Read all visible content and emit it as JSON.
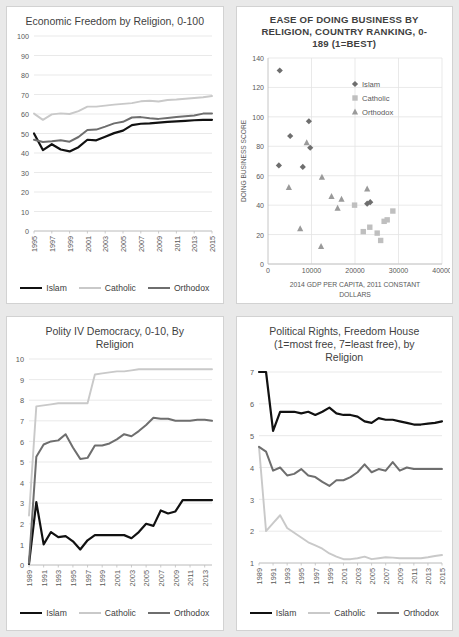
{
  "page": {
    "background": "#e9e9e9",
    "panel_background": "#ffffff",
    "panels": 4
  },
  "colors": {
    "islam": "#111111",
    "catholic": "#c9c9c9",
    "orthodox": "#6e6e6e",
    "grid": "#e3e3e3",
    "axis": "#bfbfbf",
    "text": "#595959",
    "title": "#3f3f3f"
  },
  "legend_labels": {
    "islam": "Islam",
    "catholic": "Catholic",
    "orthodox": "Orthodox"
  },
  "chart_data": [
    {
      "id": "economic-freedom",
      "type": "line",
      "title": "Economic Freedom by Religion, 0-100",
      "xlabel": "",
      "ylabel": "",
      "ylim": [
        0,
        100
      ],
      "yticks": [
        0,
        10,
        20,
        30,
        40,
        50,
        60,
        70,
        80,
        90,
        100
      ],
      "xlim": [
        1995,
        2015
      ],
      "x": [
        1995,
        1996,
        1997,
        1998,
        1999,
        2000,
        2001,
        2002,
        2003,
        2004,
        2005,
        2006,
        2007,
        2008,
        2009,
        2010,
        2011,
        2012,
        2013,
        2014,
        2015
      ],
      "xticks": [
        1995,
        1997,
        1999,
        2001,
        2003,
        2005,
        2007,
        2009,
        2011,
        2013,
        2015
      ],
      "grid": true,
      "legend_position": "bottom",
      "series": [
        {
          "name": "Islam",
          "color": "#111111",
          "values": [
            50.0,
            41.5,
            44.5,
            41.8,
            40.8,
            43.0,
            46.8,
            46.5,
            48.3,
            50.2,
            51.5,
            54.3,
            55.0,
            55.2,
            55.6,
            56.0,
            56.2,
            56.5,
            56.8,
            57.0,
            57.0
          ]
        },
        {
          "name": "Catholic",
          "color": "#c9c9c9",
          "values": [
            60.2,
            57.0,
            59.8,
            60.3,
            60.0,
            61.5,
            63.8,
            63.8,
            64.3,
            64.8,
            65.2,
            65.6,
            66.5,
            66.8,
            66.4,
            67.2,
            67.4,
            67.8,
            68.2,
            68.6,
            69.2
          ]
        },
        {
          "name": "Orthodox",
          "color": "#6e6e6e",
          "values": [
            46.8,
            45.6,
            46.0,
            46.5,
            45.8,
            48.2,
            51.8,
            52.0,
            53.5,
            55.2,
            56.0,
            58.2,
            58.4,
            57.8,
            57.5,
            58.0,
            58.4,
            58.8,
            59.2,
            60.2,
            60.2
          ]
        }
      ]
    },
    {
      "id": "ease-of-doing-business",
      "type": "scatter",
      "title": "EASE OF DOING BUSINESS BY RELIGION, COUNTRY RANKING, 0-189 (1=BEST)",
      "xlabel": "2014 GDP PER CAPITA, 2011 CONSTANT DOLLARS",
      "ylabel": "DOING BUSINESS SCORE",
      "xlim": [
        0,
        40000
      ],
      "ylim": [
        0,
        140
      ],
      "yticks": [
        0,
        20,
        40,
        60,
        80,
        100,
        120,
        140
      ],
      "xticks": [
        0,
        10000,
        20000,
        30000,
        40000
      ],
      "grid": true,
      "legend_position": "inside-top-right",
      "series": [
        {
          "name": "Islam",
          "color": "#6e6e6e",
          "marker": "diamond",
          "points": [
            [
              2700,
              131.5
            ],
            [
              5100,
              87
            ],
            [
              9400,
              97
            ],
            [
              9700,
              79
            ],
            [
              2500,
              67
            ],
            [
              8000,
              66
            ],
            [
              22800,
              41
            ],
            [
              23500,
              42
            ]
          ]
        },
        {
          "name": "Catholic",
          "color": "#bfbfbf",
          "marker": "square",
          "points": [
            [
              19900,
              40
            ],
            [
              21900,
              22
            ],
            [
              23400,
              25
            ],
            [
              25100,
              21
            ],
            [
              25900,
              16
            ],
            [
              26700,
              29
            ],
            [
              27400,
              30
            ],
            [
              28700,
              36
            ]
          ]
        },
        {
          "name": "Orthodox",
          "color": "#9a9a9a",
          "marker": "triangle",
          "points": [
            [
              4800,
              52
            ],
            [
              7400,
              24
            ],
            [
              8900,
              82.5
            ],
            [
              12400,
              59
            ],
            [
              12200,
              12
            ],
            [
              14600,
              46
            ],
            [
              16000,
              38
            ],
            [
              16900,
              44
            ],
            [
              22800,
              51
            ]
          ]
        }
      ]
    },
    {
      "id": "polity-iv-democracy",
      "type": "line",
      "title": "Polity IV Democracy, 0-10, By Religion",
      "xlabel": "",
      "ylabel": "",
      "ylim": [
        0,
        10
      ],
      "yticks": [
        0,
        1,
        2,
        3,
        4,
        5,
        6,
        7,
        8,
        9,
        10
      ],
      "xlim": [
        1989,
        2014
      ],
      "x": [
        1989,
        1990,
        1991,
        1992,
        1993,
        1994,
        1995,
        1996,
        1997,
        1998,
        1999,
        2000,
        2001,
        2002,
        2003,
        2004,
        2005,
        2006,
        2007,
        2008,
        2009,
        2010,
        2011,
        2012,
        2013,
        2014
      ],
      "xticks": [
        1989,
        1991,
        1993,
        1995,
        1997,
        1999,
        2001,
        2003,
        2005,
        2007,
        2009,
        2011,
        2013
      ],
      "grid": true,
      "legend_position": "bottom",
      "series": [
        {
          "name": "Islam",
          "color": "#111111",
          "values": [
            0.05,
            3.05,
            1.0,
            1.6,
            1.35,
            1.4,
            1.15,
            0.75,
            1.2,
            1.45,
            1.45,
            1.45,
            1.45,
            1.45,
            1.3,
            1.6,
            2.0,
            1.9,
            2.65,
            2.5,
            2.6,
            3.15,
            3.15,
            3.15,
            3.15,
            3.15
          ]
        },
        {
          "name": "Catholic",
          "color": "#c9c9c9",
          "values": [
            2.4,
            7.7,
            7.75,
            7.8,
            7.85,
            7.85,
            7.85,
            7.85,
            7.85,
            9.25,
            9.3,
            9.35,
            9.4,
            9.4,
            9.45,
            9.5,
            9.5,
            9.5,
            9.5,
            9.5,
            9.5,
            9.5,
            9.5,
            9.5,
            9.5,
            9.5
          ]
        },
        {
          "name": "Orthodox",
          "color": "#6e6e6e",
          "values": [
            0.1,
            5.25,
            5.85,
            6.0,
            6.05,
            6.35,
            5.7,
            5.15,
            5.2,
            5.8,
            5.8,
            5.9,
            6.1,
            6.35,
            6.25,
            6.5,
            6.8,
            7.15,
            7.1,
            7.1,
            7.0,
            7.0,
            7.0,
            7.05,
            7.05,
            7.0
          ]
        }
      ]
    },
    {
      "id": "political-rights-freedom-house",
      "type": "line",
      "title": "Political Rights, Freedom House (1=most free, 7=least free), by Religion",
      "xlabel": "",
      "ylabel": "",
      "ylim": [
        1,
        7
      ],
      "yticks": [
        1,
        2,
        3,
        4,
        5,
        6,
        7
      ],
      "xlim": [
        1989,
        2015
      ],
      "x": [
        1989,
        1990,
        1991,
        1992,
        1993,
        1994,
        1995,
        1996,
        1997,
        1998,
        1999,
        2000,
        2001,
        2002,
        2003,
        2004,
        2005,
        2006,
        2007,
        2008,
        2009,
        2010,
        2011,
        2012,
        2013,
        2014,
        2015
      ],
      "xticks": [
        1989,
        1991,
        1993,
        1995,
        1997,
        1999,
        2001,
        2003,
        2005,
        2007,
        2009,
        2011,
        2013,
        2015
      ],
      "grid": true,
      "legend_position": "bottom",
      "series": [
        {
          "name": "Islam",
          "color": "#111111",
          "values": [
            7.0,
            7.0,
            5.15,
            5.75,
            5.75,
            5.75,
            5.7,
            5.75,
            5.65,
            5.75,
            5.88,
            5.7,
            5.65,
            5.65,
            5.6,
            5.45,
            5.4,
            5.55,
            5.5,
            5.5,
            5.45,
            5.4,
            5.35,
            5.35,
            5.38,
            5.4,
            5.45
          ]
        },
        {
          "name": "Catholic",
          "color": "#c9c9c9",
          "values": [
            4.65,
            2.0,
            2.25,
            2.5,
            2.1,
            1.95,
            1.8,
            1.65,
            1.55,
            1.45,
            1.3,
            1.2,
            1.12,
            1.12,
            1.15,
            1.2,
            1.12,
            1.15,
            1.18,
            1.17,
            1.15,
            1.15,
            1.15,
            1.15,
            1.18,
            1.22,
            1.25
          ]
        },
        {
          "name": "Orthodox",
          "color": "#6e6e6e",
          "values": [
            4.65,
            4.5,
            3.9,
            4.0,
            3.75,
            3.8,
            3.95,
            3.75,
            3.7,
            3.55,
            3.42,
            3.6,
            3.6,
            3.7,
            3.85,
            4.1,
            3.85,
            3.95,
            3.9,
            4.17,
            3.9,
            4.0,
            3.95,
            3.95,
            3.95,
            3.95,
            3.95
          ]
        }
      ]
    }
  ]
}
